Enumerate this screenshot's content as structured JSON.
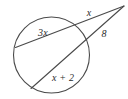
{
  "figure": {
    "background_color": "#ffffff",
    "stroke_color": "#4a4a4a",
    "label_color": "#2b2b2b",
    "labels": {
      "chord_upper": "3x",
      "external_upper": "x",
      "external_lower": "8",
      "chord_lower": "x + 2"
    },
    "geometry": {
      "circle": {
        "cx": 51.5,
        "cy": 55,
        "r": 38
      },
      "external_point": {
        "x": 124,
        "y": 6
      },
      "secant_upper": {
        "far_intersection": {
          "x": 15.5,
          "y": 47.5
        },
        "near_intersection": {
          "x": 80.5,
          "y": 30.5
        }
      },
      "secant_lower": {
        "far_intersection": {
          "x": 31,
          "y": 88.5
        },
        "near_intersection": {
          "x": 85.5,
          "y": 42.5
        }
      }
    },
    "label_positions": {
      "chord_upper": {
        "x": 43,
        "y": 33
      },
      "external_upper": {
        "x": 89,
        "y": 13
      },
      "external_lower": {
        "x": 104,
        "y": 34
      },
      "chord_lower": {
        "x": 63,
        "y": 78
      }
    }
  }
}
